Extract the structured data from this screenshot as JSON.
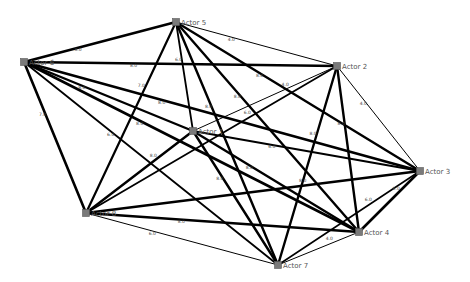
{
  "chart_data": {
    "type": "network",
    "title": "",
    "nodes": [
      {
        "id": "Actor 5",
        "label": "Actor 5",
        "x": 176,
        "y": 22
      },
      {
        "id": "Actor 6",
        "label": "Actor 6",
        "x": 24,
        "y": 62
      },
      {
        "id": "Actor 2",
        "label": "Actor 2",
        "x": 337,
        "y": 66
      },
      {
        "id": "Actor 1",
        "label": "Actor 1",
        "x": 193,
        "y": 131
      },
      {
        "id": "Actor 3",
        "label": "Actor 3",
        "x": 420,
        "y": 171
      },
      {
        "id": "Actor 8",
        "label": "Actor 8",
        "x": 86,
        "y": 213
      },
      {
        "id": "Actor 4",
        "label": "Actor 4",
        "x": 359,
        "y": 232
      },
      {
        "id": "Actor 7",
        "label": "Actor 7",
        "x": 278,
        "y": 265
      }
    ],
    "edges": [
      {
        "source": "Actor 6",
        "target": "Actor 5",
        "weight": "8.0",
        "width": 2.6
      },
      {
        "source": "Actor 6",
        "target": "Actor 2",
        "weight": "8.0",
        "width": 2.4
      },
      {
        "source": "Actor 6",
        "target": "Actor 1",
        "weight": "8.0",
        "width": 2.4
      },
      {
        "source": "Actor 6",
        "target": "Actor 3",
        "weight": "8.0",
        "width": 2.6
      },
      {
        "source": "Actor 6",
        "target": "Actor 8",
        "weight": "7.0",
        "width": 2.6
      },
      {
        "source": "Actor 6",
        "target": "Actor 4",
        "weight": "8.0",
        "width": 2.6
      },
      {
        "source": "Actor 6",
        "target": "Actor 7",
        "weight": "6.0",
        "width": 1.8
      },
      {
        "source": "Actor 5",
        "target": "Actor 2",
        "weight": "4.0",
        "width": 1.0
      },
      {
        "source": "Actor 5",
        "target": "Actor 1",
        "weight": "6.0",
        "width": 1.8
      },
      {
        "source": "Actor 5",
        "target": "Actor 3",
        "weight": "8.0",
        "width": 2.4
      },
      {
        "source": "Actor 5",
        "target": "Actor 8",
        "weight": "7.0",
        "width": 2.2
      },
      {
        "source": "Actor 5",
        "target": "Actor 4",
        "weight": "8.0",
        "width": 2.4
      },
      {
        "source": "Actor 5",
        "target": "Actor 7",
        "weight": "8.0",
        "width": 2.4
      },
      {
        "source": "Actor 2",
        "target": "Actor 1",
        "weight": "4.0",
        "width": 1.0
      },
      {
        "source": "Actor 2",
        "target": "Actor 3",
        "weight": "4.0",
        "width": 1.0
      },
      {
        "source": "Actor 2",
        "target": "Actor 8",
        "weight": "6.0",
        "width": 1.8
      },
      {
        "source": "Actor 2",
        "target": "Actor 4",
        "weight": "8.0",
        "width": 2.4
      },
      {
        "source": "Actor 2",
        "target": "Actor 7",
        "weight": "8.0",
        "width": 2.4
      },
      {
        "source": "Actor 1",
        "target": "Actor 3",
        "weight": "6.0",
        "width": 1.8
      },
      {
        "source": "Actor 1",
        "target": "Actor 8",
        "weight": "8.0",
        "width": 2.4
      },
      {
        "source": "Actor 1",
        "target": "Actor 4",
        "weight": "8.0",
        "width": 2.4
      },
      {
        "source": "Actor 1",
        "target": "Actor 7",
        "weight": "8.0",
        "width": 2.4
      },
      {
        "source": "Actor 3",
        "target": "Actor 8",
        "weight": "8.0",
        "width": 2.4
      },
      {
        "source": "Actor 3",
        "target": "Actor 4",
        "weight": "8.0",
        "width": 2.6
      },
      {
        "source": "Actor 3",
        "target": "Actor 7",
        "weight": "6.0",
        "width": 1.6
      },
      {
        "source": "Actor 8",
        "target": "Actor 4",
        "weight": "8.0",
        "width": 2.4
      },
      {
        "source": "Actor 8",
        "target": "Actor 7",
        "weight": "6.0",
        "width": 1.0
      },
      {
        "source": "Actor 4",
        "target": "Actor 7",
        "weight": "4.0",
        "width": 1.0
      }
    ]
  }
}
